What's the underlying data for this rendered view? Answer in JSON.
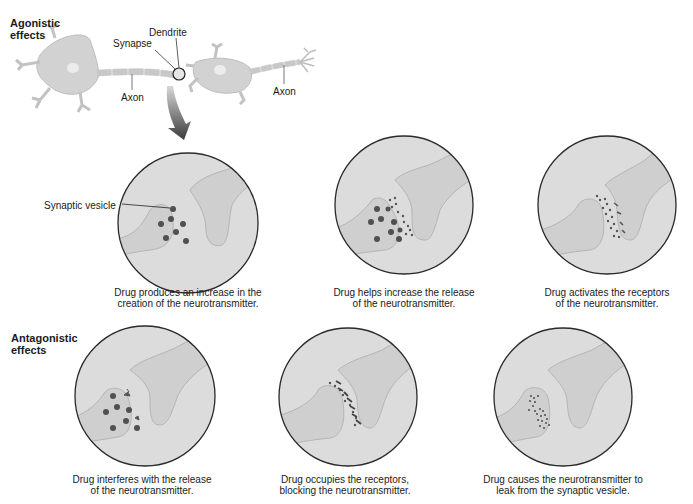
{
  "sections": {
    "agonistic": {
      "title_line1": "Agonistic",
      "title_line2": "effects"
    },
    "antagonistic": {
      "title_line1": "Antagonistic",
      "title_line2": "effects"
    }
  },
  "neuron_labels": {
    "dendrite": "Dendrite",
    "synapse": "Synapse",
    "axon_left": "Axon",
    "axon_right": "Axon",
    "synaptic_vesicle": "Synaptic vesicle"
  },
  "panels": [
    {
      "id": "increase-creation",
      "group": "agonistic",
      "caption_line1": "Drug produces an increase in the",
      "caption_line2": "creation of the neurotransmitter."
    },
    {
      "id": "increase-release",
      "group": "agonistic",
      "caption_line1": "Drug helps increase the release",
      "caption_line2": "of the neurotransmitter."
    },
    {
      "id": "activate-receptors",
      "group": "agonistic",
      "caption_line1": "Drug activates the receptors",
      "caption_line2": "of the neurotransmitter."
    },
    {
      "id": "interfere-release",
      "group": "antagonistic",
      "caption_line1": "Drug interferes with the release",
      "caption_line2": "of the neurotransmitter."
    },
    {
      "id": "occupy-receptors",
      "group": "antagonistic",
      "caption_line1": "Drug occupies the receptors,",
      "caption_line2": "blocking the neurotransmitter."
    },
    {
      "id": "leak-vesicle",
      "group": "antagonistic",
      "caption_line1": "Drug causes the neurotransmitter to",
      "caption_line2": "leak from the synaptic vesicle."
    }
  ],
  "colors": {
    "circle_fill": "#dcdcdc",
    "circle_stroke": "#2a2a2a",
    "neuron_fill": "#cfcfcf",
    "neuron_stroke": "#b4b4b4",
    "dot": "#555555",
    "arrow_dark": "#3a3a3a",
    "arrow_light": "#9a9a9a"
  }
}
